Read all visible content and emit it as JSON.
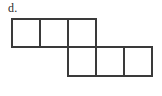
{
  "figure": {
    "label": "d.",
    "kind": "polyomino-net",
    "background_color": "#ffffff",
    "line_color": "#3a3a3a",
    "line_width": 2,
    "cell_size": 28,
    "grid": {
      "origin_x": 12,
      "origin_y": 19,
      "rows": [
        {
          "name": "top-row",
          "row_index": 0,
          "col_start": 0,
          "count": 3
        },
        {
          "name": "bottom-row",
          "row_index": 1,
          "col_start": 2,
          "count": 3
        }
      ]
    },
    "cells": [
      {
        "name": "top-row-cell-1",
        "row": 0,
        "col": 0,
        "x": 12,
        "y": 19,
        "w": 28,
        "h": 28
      },
      {
        "name": "top-row-cell-2",
        "row": 0,
        "col": 1,
        "x": 40,
        "y": 19,
        "w": 28,
        "h": 28
      },
      {
        "name": "top-row-cell-3",
        "row": 0,
        "col": 2,
        "x": 68,
        "y": 19,
        "w": 28,
        "h": 28
      },
      {
        "name": "bottom-row-cell-1",
        "row": 1,
        "col": 2,
        "x": 68,
        "y": 47,
        "w": 28,
        "h": 29
      },
      {
        "name": "bottom-row-cell-2",
        "row": 1,
        "col": 3,
        "x": 96,
        "y": 47,
        "w": 28,
        "h": 29
      },
      {
        "name": "bottom-row-cell-3",
        "row": 1,
        "col": 4,
        "x": 124,
        "y": 47,
        "w": 28,
        "h": 29
      }
    ],
    "outline_points": "12,19 96,19 96,47 152,47 152,76 68,76 68,47 12,47 12,19",
    "inner_lines": [
      {
        "name": "top-divider-1",
        "x1": 40,
        "y1": 19,
        "x2": 40,
        "y2": 47
      },
      {
        "name": "top-divider-2",
        "x1": 68,
        "y1": 19,
        "x2": 68,
        "y2": 47
      },
      {
        "name": "bottom-divider-1",
        "x1": 96,
        "y1": 47,
        "x2": 96,
        "y2": 76
      },
      {
        "name": "bottom-divider-2",
        "x1": 124,
        "y1": 47,
        "x2": 124,
        "y2": 76
      },
      {
        "name": "row-separator",
        "x1": 68,
        "y1": 47,
        "x2": 96,
        "y2": 47
      }
    ]
  }
}
